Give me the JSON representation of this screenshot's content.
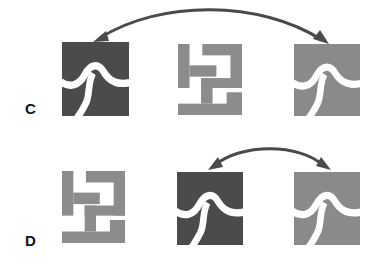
{
  "rows": [
    {
      "label": "C",
      "tiles": [
        {
          "shape": "puzzle",
          "shade": "dark",
          "color": "#4b4b4b"
        },
        {
          "shape": "maze",
          "shade": "light",
          "color": "#8c8c8c"
        },
        {
          "shape": "puzzle",
          "shade": "light",
          "color": "#8a8a8a"
        }
      ],
      "arrow": {
        "from_tile": 3,
        "to_tile": 1,
        "type": "double-headed"
      }
    },
    {
      "label": "D",
      "tiles": [
        {
          "shape": "maze",
          "shade": "light",
          "color": "#8c8c8c"
        },
        {
          "shape": "puzzle",
          "shade": "dark",
          "color": "#4b4b4b"
        },
        {
          "shape": "puzzle",
          "shade": "light",
          "color": "#8a8a8a"
        }
      ],
      "arrow": {
        "from_tile": 2,
        "to_tile": 3,
        "type": "double-headed"
      }
    }
  ],
  "colors": {
    "arrow": "#4a4a4a",
    "background": "#ffffff"
  }
}
